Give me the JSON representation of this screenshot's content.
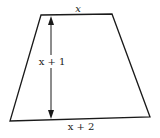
{
  "diagram": {
    "shape": "trapezoid",
    "stroke_color": "#1a1a1a",
    "background": "#ffffff",
    "vertices": {
      "top_left": [
        41,
        15
      ],
      "top_right": [
        112,
        14
      ],
      "bottom_right": [
        150,
        117
      ],
      "bottom_left": [
        10,
        121
      ]
    },
    "labels": {
      "top": "x",
      "height": "x + 1",
      "bottom": "x + 2"
    },
    "height_arrow": {
      "x": 51,
      "y_top": 16,
      "y_bottom": 119
    }
  }
}
